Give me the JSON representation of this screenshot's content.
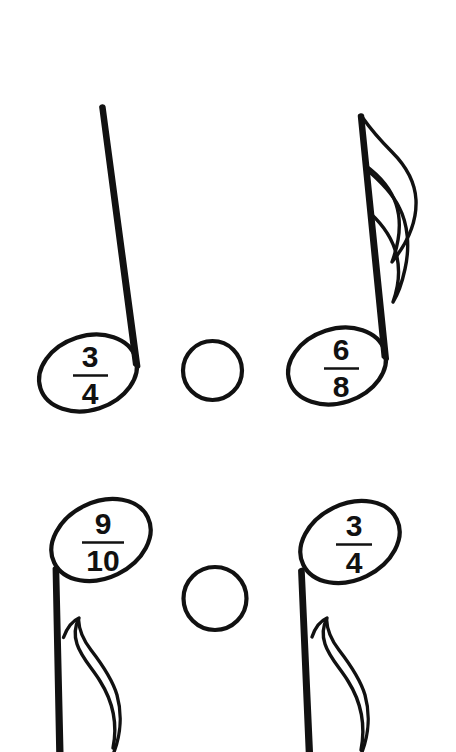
{
  "page": {
    "kind": "fraction-comparison-worksheet",
    "background_color": "#ffffff",
    "ink_color": "#111111",
    "width": 456,
    "height": 752
  },
  "problems": [
    {
      "id": "problem-1",
      "left": {
        "numerator": "3",
        "denominator": "4",
        "note_type": "quarter-note",
        "stem_direction": "up",
        "has_flag": false
      },
      "operator": {
        "shape": "circle",
        "value": "",
        "label": "blank comparison circle"
      },
      "right": {
        "numerator": "6",
        "denominator": "8",
        "note_type": "eighth-note",
        "stem_direction": "up",
        "has_flag": true
      }
    },
    {
      "id": "problem-2",
      "left": {
        "numerator": "9",
        "denominator": "10",
        "note_type": "eighth-note",
        "stem_direction": "down",
        "has_flag": true
      },
      "operator": {
        "shape": "circle",
        "value": "",
        "label": "blank comparison circle"
      },
      "right": {
        "numerator": "3",
        "denominator": "4",
        "note_type": "eighth-note",
        "stem_direction": "down",
        "has_flag": true
      }
    }
  ]
}
